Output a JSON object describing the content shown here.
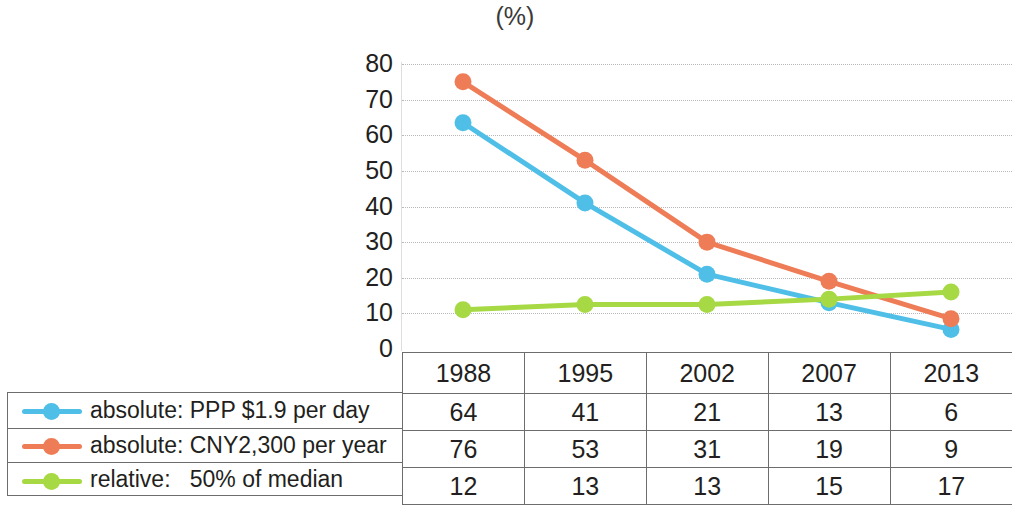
{
  "header": {
    "title": "",
    "subtitle": "(%)"
  },
  "chart_data": {
    "type": "line",
    "title": "",
    "subtitle": "(%)",
    "xlabel": "",
    "ylabel": "(%)",
    "ylim": [
      0,
      80
    ],
    "ytick_step": 10,
    "yticks": [
      "80",
      "70",
      "60",
      "50",
      "40",
      "30",
      "20",
      "10",
      "0"
    ],
    "grid": true,
    "legend_position": "bottom-left-table",
    "categories": [
      "1988",
      "1995",
      "2002",
      "2007",
      "2013"
    ],
    "series": [
      {
        "name": "absolute: PPP $1.9 per day",
        "color": "#4FBFE8",
        "values": [
          64,
          41,
          21,
          13,
          6
        ],
        "plotted": [
          63.5,
          41,
          21,
          13,
          5.5
        ]
      },
      {
        "name": "absolute: CNY2,300 per year",
        "color": "#EE7D57",
        "values": [
          76,
          53,
          31,
          19,
          9
        ],
        "plotted": [
          75,
          53,
          30,
          19,
          8.5
        ]
      },
      {
        "name": "relative:   50% of median",
        "color": "#A7D945",
        "values": [
          12,
          13,
          13,
          15,
          17
        ],
        "plotted": [
          11,
          12.5,
          12.5,
          14,
          16
        ]
      }
    ]
  },
  "table": {
    "header": [
      "1988",
      "1995",
      "2002",
      "2007",
      "2013"
    ],
    "rows": [
      {
        "label": "absolute: PPP $1.9 per day",
        "values": [
          "64",
          "41",
          "21",
          "13",
          "6"
        ]
      },
      {
        "label": "absolute: CNY2,300 per year",
        "values": [
          "76",
          "53",
          "31",
          "19",
          "9"
        ]
      },
      {
        "label": "relative:   50% of median",
        "values": [
          "12",
          "13",
          "13",
          "15",
          "17"
        ]
      }
    ]
  },
  "colors": {
    "blue": "#4FBFE8",
    "orange": "#EE7D57",
    "green": "#A7D945",
    "grid": "#b9b9bb",
    "border": "#6d6d6d",
    "text": "#231f20"
  }
}
